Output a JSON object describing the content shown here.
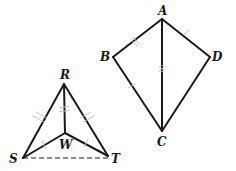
{
  "figure": {
    "kite": {
      "vertices": [
        "A",
        "B",
        "C",
        "D"
      ],
      "segments": [
        "AB",
        "BC",
        "CD",
        "DA",
        "AC"
      ],
      "faint_mark_label": "S"
    },
    "triangle": {
      "vertices": [
        "R",
        "S",
        "T"
      ],
      "interior_point": "W",
      "segments": [
        "RS",
        "RT",
        "RW",
        "SW",
        "TW"
      ],
      "dashed_segments": [
        "ST"
      ]
    },
    "labels": {
      "A": "A",
      "B": "B",
      "C": "C",
      "D": "D",
      "R": "R",
      "S": "S",
      "T": "T",
      "W": "W"
    },
    "colors": {
      "line": "#1a1a1a",
      "tick": "#c4c4c4",
      "background": "#ffffff"
    }
  }
}
